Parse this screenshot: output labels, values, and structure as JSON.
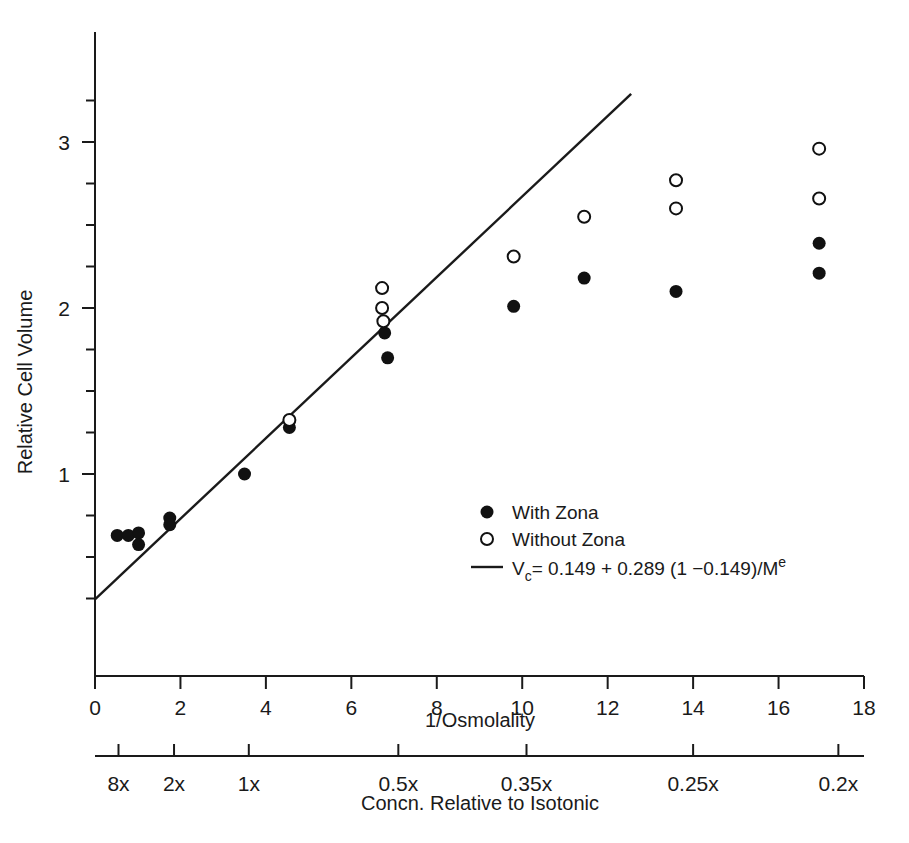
{
  "figure": {
    "name": "relative-cell-volume-vs-inverse-osmolality"
  },
  "axes": {
    "y": {
      "label": "Relative Cell Volume",
      "ticks": [
        "1",
        "2",
        "3"
      ],
      "tick_values": [
        1,
        2,
        3
      ],
      "minor_step": 0.25,
      "range": [
        0.18,
        3.48
      ]
    },
    "x": {
      "label": "1/Osmolality",
      "ticks": [
        "0",
        "2",
        "4",
        "6",
        "8",
        "10",
        "12",
        "14",
        "16",
        "18"
      ],
      "tick_values": [
        0,
        2,
        4,
        6,
        8,
        10,
        12,
        14,
        16,
        18
      ],
      "range": [
        0,
        18
      ]
    },
    "x2": {
      "label": "Concn. Relative to Isotonic",
      "ticks": [
        "8x",
        "2x",
        "1x",
        "0.5x",
        "0.35x",
        "0.25x",
        "0.2x"
      ],
      "tick_positions": [
        0.55,
        1.85,
        3.6,
        7.1,
        10.1,
        14.0,
        17.4
      ]
    }
  },
  "legend": {
    "items": [
      {
        "label": "With Zona",
        "marker": "filled-circle"
      },
      {
        "label": "Without Zona",
        "marker": "open-circle"
      },
      {
        "label": "V_c = 0.149 + 0.289 (1 − 0.149)/M^e",
        "marker": "line"
      }
    ],
    "equation": {
      "lhs_symbol": "V",
      "lhs_subscript": "c",
      "rhs": "= 0.149 + 0.289 (1 −0.149)/M",
      "rhs_superscript": "e"
    }
  },
  "chart_data": {
    "type": "scatter",
    "title": "",
    "xlabel": "1/Osmolality",
    "ylabel": "Relative Cell Volume",
    "xlim": [
      0,
      18
    ],
    "ylim": [
      0.18,
      3.48
    ],
    "grid": false,
    "legend_position": "inside-right-middle",
    "series": [
      {
        "name": "With Zona",
        "marker": "filled-circle",
        "points": [
          [
            0.52,
            0.63
          ],
          [
            0.78,
            0.63
          ],
          [
            1.02,
            0.645
          ],
          [
            1.02,
            0.575
          ],
          [
            1.75,
            0.735
          ],
          [
            1.75,
            0.695
          ],
          [
            3.5,
            1.0
          ],
          [
            4.55,
            1.28
          ],
          [
            6.78,
            1.85
          ],
          [
            6.85,
            1.7
          ],
          [
            9.8,
            2.01
          ],
          [
            11.45,
            2.18
          ],
          [
            13.6,
            2.1
          ],
          [
            16.95,
            2.39
          ],
          [
            16.95,
            2.21
          ]
        ]
      },
      {
        "name": "Without Zona",
        "marker": "open-circle",
        "points": [
          [
            4.55,
            1.325
          ],
          [
            6.72,
            2.12
          ],
          [
            6.72,
            2.0
          ],
          [
            6.75,
            1.92
          ],
          [
            9.8,
            2.31
          ],
          [
            11.45,
            2.55
          ],
          [
            13.6,
            2.77
          ],
          [
            13.6,
            2.6
          ],
          [
            16.95,
            2.96
          ],
          [
            16.95,
            2.66
          ]
        ]
      }
    ],
    "fit_line": {
      "name": "V_c = 0.149 + 0.289 (1 − 0.149)/M^e",
      "x_start": 0.0,
      "y_start": 0.245,
      "x_end": 12.55,
      "y_end": 3.29
    }
  }
}
